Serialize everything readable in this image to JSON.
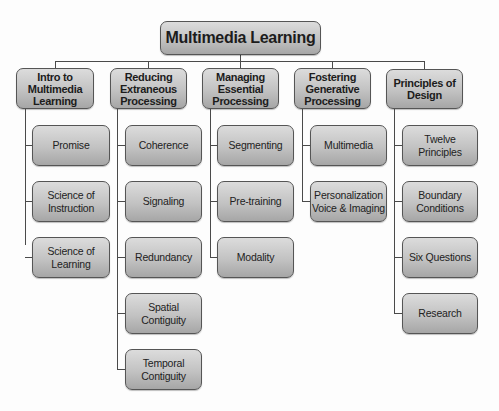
{
  "diagram": {
    "type": "hierarchy",
    "root": {
      "label": "Multimedia Learning"
    },
    "categories": [
      {
        "label": "Intro to\nMultimedia\nLearning",
        "children": [
          "Promise",
          "Science of\nInstruction",
          "Science of\nLearning"
        ]
      },
      {
        "label": "Reducing\nExtraneous\nProcessing",
        "children": [
          "Coherence",
          "Signaling",
          "Redundancy",
          "Spatial\nContiguity",
          "Temporal\nContiguity"
        ]
      },
      {
        "label": "Managing\nEssential\nProcessing",
        "children": [
          "Segmenting",
          "Pre-training",
          "Modality"
        ]
      },
      {
        "label": "Fostering\nGenerative\nProcessing",
        "children": [
          "Multimedia",
          "Personalization\nVoice & Imaging"
        ]
      },
      {
        "label": "Principles of\nDesign",
        "children": [
          "Twelve\nPrinciples",
          "Boundary\nConditions",
          "Six Questions",
          "Research"
        ]
      }
    ]
  }
}
